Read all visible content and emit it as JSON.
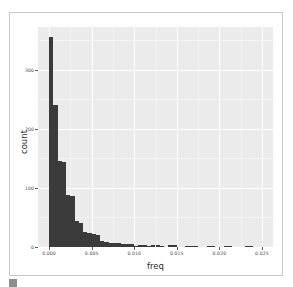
{
  "card": {
    "name": "histogram-plot-card"
  },
  "chart_data": {
    "type": "bar",
    "subtype": "histogram",
    "title": "",
    "xlabel": "freq",
    "ylabel": "count",
    "xlim": [
      -0.0013,
      0.0263
    ],
    "ylim": [
      0,
      372
    ],
    "grid": true,
    "legend": "none",
    "panel_background": "#ebebeb",
    "gridline_color": "#ffffff",
    "bar_color": "#3b3b3b",
    "bin_width": 0.0005,
    "xticks": [
      "0.000",
      "0.005",
      "0.010",
      "0.015",
      "0.020",
      "0.025"
    ],
    "xtick_values": [
      0.0,
      0.005,
      0.01,
      0.015,
      0.02,
      0.025
    ],
    "yticks": [
      "0",
      "100",
      "200",
      "300"
    ],
    "ytick_values": [
      0,
      100,
      200,
      300
    ],
    "bins": [
      {
        "x": 0.00025,
        "value": 355
      },
      {
        "x": 0.00075,
        "value": 240
      },
      {
        "x": 0.00125,
        "value": 145
      },
      {
        "x": 0.00175,
        "value": 143
      },
      {
        "x": 0.00225,
        "value": 88
      },
      {
        "x": 0.00275,
        "value": 86
      },
      {
        "x": 0.00325,
        "value": 44
      },
      {
        "x": 0.00375,
        "value": 40
      },
      {
        "x": 0.00425,
        "value": 26
      },
      {
        "x": 0.00475,
        "value": 24
      },
      {
        "x": 0.00525,
        "value": 22
      },
      {
        "x": 0.00575,
        "value": 20
      },
      {
        "x": 0.00625,
        "value": 10
      },
      {
        "x": 0.00675,
        "value": 8
      },
      {
        "x": 0.00725,
        "value": 7
      },
      {
        "x": 0.00775,
        "value": 6
      },
      {
        "x": 0.00825,
        "value": 6
      },
      {
        "x": 0.00875,
        "value": 5
      },
      {
        "x": 0.00925,
        "value": 5
      },
      {
        "x": 0.00975,
        "value": 5
      },
      {
        "x": 0.01025,
        "value": 1
      },
      {
        "x": 0.01075,
        "value": 4
      },
      {
        "x": 0.01125,
        "value": 4
      },
      {
        "x": 0.01175,
        "value": 1
      },
      {
        "x": 0.01225,
        "value": 3
      },
      {
        "x": 0.01275,
        "value": 3
      },
      {
        "x": 0.01325,
        "value": 1
      },
      {
        "x": 0.01425,
        "value": 3
      },
      {
        "x": 0.01475,
        "value": 3
      },
      {
        "x": 0.01625,
        "value": 2
      },
      {
        "x": 0.01675,
        "value": 2
      },
      {
        "x": 0.01725,
        "value": 2
      },
      {
        "x": 0.01875,
        "value": 2
      },
      {
        "x": 0.01925,
        "value": 2
      },
      {
        "x": 0.02075,
        "value": 2
      },
      {
        "x": 0.02125,
        "value": 2
      },
      {
        "x": 0.02325,
        "value": 2
      },
      {
        "x": 0.02375,
        "value": 2
      }
    ]
  }
}
